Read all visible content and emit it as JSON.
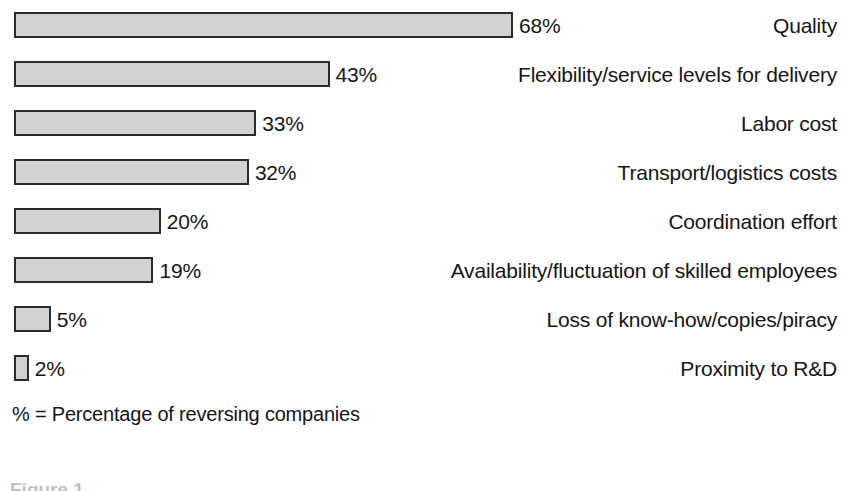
{
  "chart_data": {
    "type": "bar",
    "orientation": "horizontal",
    "title": "",
    "subtitle": "",
    "xlabel": "",
    "ylabel": "",
    "xlim": [
      0,
      68
    ],
    "grid": false,
    "legend": null,
    "value_suffix": "%",
    "footnote": "% = Percentage of reversing companies",
    "caption_partial": "Figure 1",
    "bar_fill_color": "#d2d2d2",
    "bar_border_color": "#2b2b2b",
    "text_color": "#151515",
    "background_color": "#ffffff",
    "categories": [
      "Quality",
      "Flexibility/service levels for delivery",
      "Labor cost",
      "Transport/logistics costs",
      "Coordination effort",
      "Availability/fluctuation of skilled employees",
      "Loss of know-how/copies/piracy",
      "Proximity to R&D"
    ],
    "values": [
      68,
      43,
      33,
      32,
      20,
      19,
      5,
      2
    ],
    "value_labels": [
      "68%",
      "43%",
      "33%",
      "32%",
      "20%",
      "19%",
      "5%",
      "2%"
    ],
    "bars": [
      {
        "label": "Quality",
        "value": 68,
        "value_label": "68%"
      },
      {
        "label": "Flexibility/service levels for delivery",
        "value": 43,
        "value_label": "43%"
      },
      {
        "label": "Labor cost",
        "value": 33,
        "value_label": "33%"
      },
      {
        "label": "Transport/logistics costs",
        "value": 32,
        "value_label": "32%"
      },
      {
        "label": "Coordination effort",
        "value": 20,
        "value_label": "20%"
      },
      {
        "label": "Availability/fluctuation of skilled employees",
        "value": 19,
        "value_label": "19%"
      },
      {
        "label": "Loss of know-how/copies/piracy",
        "value": 5,
        "value_label": "5%"
      },
      {
        "label": "Proximity to R&D",
        "value": 2,
        "value_label": "2%"
      }
    ]
  },
  "layout": {
    "bar_origin_x": 14,
    "first_bar_top": 12,
    "row_pitch": 49,
    "bar_height": 26,
    "px_per_unit": 7.34,
    "value_gap": 6,
    "footnote_top": 404,
    "label_right_edge": 837
  }
}
